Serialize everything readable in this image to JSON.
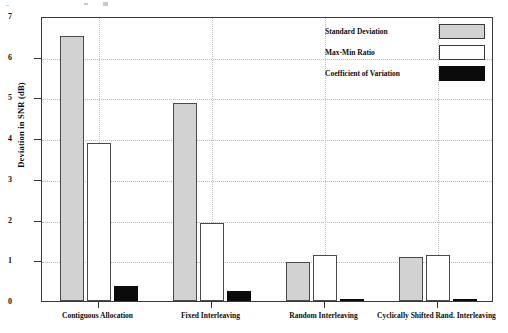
{
  "chart_data": {
    "type": "bar",
    "title": "",
    "xlabel": "",
    "ylabel": "Deviation in SNR (dB)",
    "ylim": [
      0,
      7
    ],
    "ytick_values": [
      0,
      1,
      2,
      3,
      4,
      5,
      6,
      7
    ],
    "ytick_labels": [
      "0",
      "1",
      "2",
      "3",
      "4",
      "5",
      "6",
      "7"
    ],
    "grid": "dotted horizontal gridlines and dotted vertical category lines",
    "legend_position": "upper right inside plot",
    "categories": [
      "Contiguous Allocation",
      "Fixed Interleaving",
      "Random Interleaving",
      "Cyclically Shifted Rand. Interleaving"
    ],
    "series": [
      {
        "name": "Standard Deviation",
        "color": "#d2d2d2",
        "values": [
          6.5,
          4.87,
          0.97,
          1.07
        ]
      },
      {
        "name": "Max-Min Ratio",
        "color": "#ffffff",
        "values": [
          3.87,
          1.92,
          1.13,
          1.13
        ]
      },
      {
        "name": "Coefficient of Variation",
        "color": "#0b0b0b",
        "values": [
          0.37,
          0.25,
          0.04,
          0.04
        ]
      }
    ]
  },
  "axis": {
    "y_title": "Deviation in SNR (dB)"
  },
  "legend": {
    "items": [
      {
        "label": "Standard Deviation",
        "swatch": "gray"
      },
      {
        "label": "Max-Min Ratio",
        "swatch": "white"
      },
      {
        "label": "Coefficient of Variation",
        "swatch": "black"
      }
    ]
  }
}
